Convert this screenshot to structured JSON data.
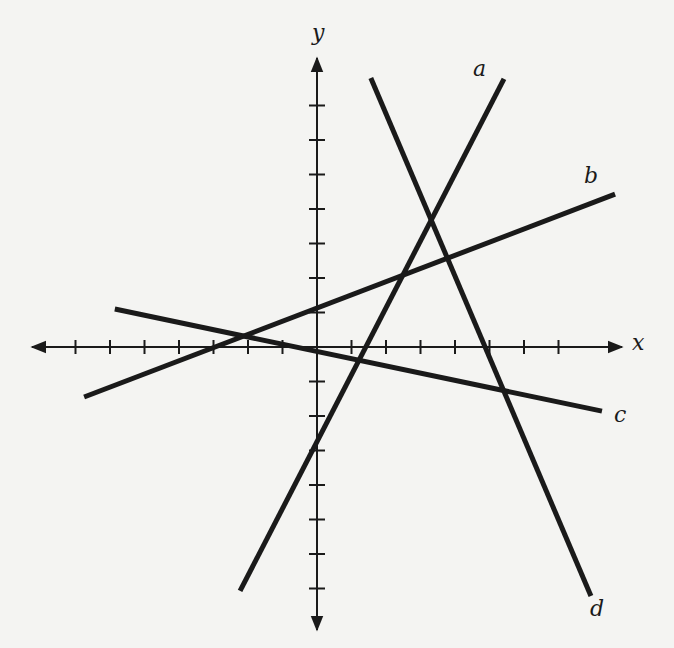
{
  "chart_data": {
    "type": "line",
    "title": "",
    "xlabel": "x",
    "ylabel": "y",
    "xlim": [
      -8,
      9
    ],
    "ylim": [
      -8,
      8
    ],
    "grid": false,
    "tick_spacing": 1,
    "x_ticks": [
      -7,
      -6,
      -5,
      -4,
      -3,
      -2,
      -1,
      1,
      2,
      3,
      4,
      5,
      6,
      7
    ],
    "y_ticks": [
      -7,
      -6,
      -5,
      -4,
      -3,
      -2,
      -1,
      1,
      2,
      3,
      4,
      5,
      6,
      7
    ],
    "series": [
      {
        "name": "a",
        "x": [
          -2.23,
          5.42
        ],
        "y": [
          -7.07,
          7.77
        ],
        "equation": "y = 2x - 3"
      },
      {
        "name": "b",
        "x": [
          -6.75,
          8.64
        ],
        "y": [
          -1.45,
          4.43
        ],
        "equation": "y ≈ 0.38x + 1"
      },
      {
        "name": "c",
        "x": [
          -5.86,
          8.26
        ],
        "y": [
          1.1,
          -1.86
        ],
        "equation": "y ≈ -0.2x"
      },
      {
        "name": "d",
        "x": [
          1.56,
          7.94
        ],
        "y": [
          7.8,
          -7.22
        ],
        "equation": "y ≈ -2.35x + 11.5"
      }
    ]
  },
  "labels": {
    "x_axis": "x",
    "y_axis": "y",
    "a": "a",
    "b": "b",
    "c": "c",
    "d": "d"
  },
  "colors": {
    "background": "#f4f4f2",
    "ink": "#1a1a1a"
  }
}
